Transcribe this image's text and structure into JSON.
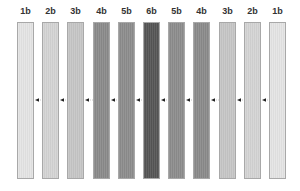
{
  "diagram": {
    "bars": [
      {
        "label": "1b",
        "color": "#e4e4e4"
      },
      {
        "label": "2b",
        "color": "#d4d4d4"
      },
      {
        "label": "3b",
        "color": "#c6c6c6"
      },
      {
        "label": "4b",
        "color": "#8a8a8a"
      },
      {
        "label": "5b",
        "color": "#8c8c8c"
      },
      {
        "label": "6b",
        "color": "#555555"
      },
      {
        "label": "5b",
        "color": "#8c8c8c"
      },
      {
        "label": "4b",
        "color": "#8a8a8a"
      },
      {
        "label": "3b",
        "color": "#c6c6c6"
      },
      {
        "label": "2b",
        "color": "#d4d4d4"
      },
      {
        "label": "1b",
        "color": "#e4e4e4"
      }
    ],
    "arrow_direction": "left",
    "arrow_icon": "arrow-left-icon"
  }
}
